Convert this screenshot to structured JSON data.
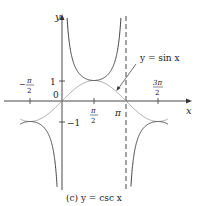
{
  "chart_data": {
    "type": "line",
    "title": "(c) y = csc x",
    "caption": "(c) y = csc x",
    "xlabel": "x",
    "ylabel": "y",
    "xlim": [
      -3.0,
      4.0
    ],
    "ylim": [
      -4.0,
      5.0
    ],
    "grid": false,
    "x_ticks": [
      {
        "value": -1.5708,
        "label": "-π/2"
      },
      {
        "value": 1.5708,
        "label": "π/2"
      },
      {
        "value": 3.1416,
        "label": "π"
      },
      {
        "value": 4.7124,
        "label": "3π/2"
      }
    ],
    "y_ticks": [
      {
        "value": 1,
        "label": "1"
      },
      {
        "value": -1,
        "label": "-1"
      }
    ],
    "origin_label": "0",
    "series": [
      {
        "name": "y = csc x",
        "style": "solid",
        "color": "#333333",
        "description": "cosecant with vertical asymptotes at x = 0 and x = π; local min 1 at π/2, local max -1 at -π/2 and 3π/2"
      },
      {
        "name": "y = sin x",
        "style": "solid",
        "color": "#999999",
        "description": "sine curve, shown lighter, annotated with arrow"
      }
    ],
    "asymptotes": [
      {
        "x": 3.1416,
        "style": "dashed"
      }
    ],
    "annotations": [
      {
        "text": "y = sin x",
        "points_to": {
          "x": 2.5,
          "y": 0.6
        }
      }
    ]
  },
  "labels": {
    "y_axis": "y",
    "x_axis": "x",
    "origin": "0",
    "one": "1",
    "minus_one": "−1",
    "pi": "π",
    "pi_half_num": "π",
    "pi_half_den": "2",
    "neg_pi_half_sign": "−",
    "neg_pi_half_num": "π",
    "neg_pi_half_den": "2",
    "three_pi_half_num": "3π",
    "three_pi_half_den": "2",
    "sin_annotation": "y = sin x",
    "caption": "(c) y = csc x"
  }
}
